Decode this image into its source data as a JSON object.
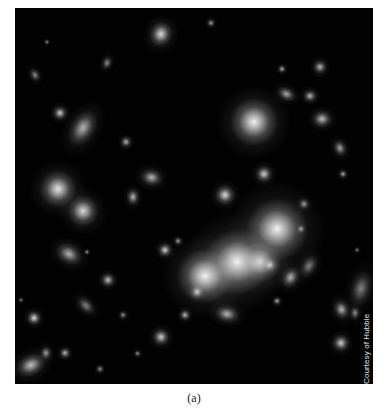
{
  "figure": {
    "background": "#020202",
    "credit": "Courtesy of Hubble",
    "caption": "(a)",
    "galaxies": [
      {
        "x": 222,
        "y": 97,
        "w": 34,
        "h": 34,
        "r": 0,
        "b": 0.95
      },
      {
        "x": 198,
        "y": 232,
        "w": 48,
        "h": 44,
        "r": -20,
        "b": 1.0
      },
      {
        "x": 170,
        "y": 250,
        "w": 40,
        "h": 36,
        "r": 0,
        "b": 0.95
      },
      {
        "x": 240,
        "y": 200,
        "w": 44,
        "h": 42,
        "r": 0,
        "b": 0.95
      },
      {
        "x": 230,
        "y": 240,
        "w": 30,
        "h": 28,
        "r": 0,
        "b": 0.8
      },
      {
        "x": 203,
        "y": 180,
        "w": 14,
        "h": 14,
        "r": 0,
        "b": 0.85
      },
      {
        "x": 243,
        "y": 160,
        "w": 12,
        "h": 12,
        "r": 0,
        "b": 0.8
      },
      {
        "x": 30,
        "y": 168,
        "w": 26,
        "h": 26,
        "r": 0,
        "b": 0.9
      },
      {
        "x": 57,
        "y": 192,
        "w": 22,
        "h": 22,
        "r": 0,
        "b": 0.85
      },
      {
        "x": 139,
        "y": 17,
        "w": 14,
        "h": 18,
        "r": 20,
        "b": 0.85
      },
      {
        "x": 65,
        "y": 106,
        "w": 6,
        "h": 28,
        "r": 30,
        "b": 0.7
      },
      {
        "x": 40,
        "y": 100,
        "w": 10,
        "h": 10,
        "r": 0,
        "b": 0.8
      },
      {
        "x": 107,
        "y": 130,
        "w": 8,
        "h": 8,
        "r": 0,
        "b": 0.7
      },
      {
        "x": 129,
        "y": 166,
        "w": 16,
        "h": 8,
        "r": 10,
        "b": 0.7
      },
      {
        "x": 115,
        "y": 183,
        "w": 6,
        "h": 12,
        "r": 0,
        "b": 0.7
      },
      {
        "x": 145,
        "y": 237,
        "w": 10,
        "h": 10,
        "r": 0,
        "b": 0.8
      },
      {
        "x": 44,
        "y": 242,
        "w": 20,
        "h": 8,
        "r": 30,
        "b": 0.7
      },
      {
        "x": 14,
        "y": 305,
        "w": 10,
        "h": 10,
        "r": 0,
        "b": 0.85
      },
      {
        "x": 5,
        "y": 353,
        "w": 22,
        "h": 8,
        "r": -25,
        "b": 0.75
      },
      {
        "x": 46,
        "y": 341,
        "w": 8,
        "h": 8,
        "r": 0,
        "b": 0.7
      },
      {
        "x": 88,
        "y": 267,
        "w": 10,
        "h": 10,
        "r": 0,
        "b": 0.75
      },
      {
        "x": 140,
        "y": 323,
        "w": 12,
        "h": 12,
        "r": 0,
        "b": 0.8
      },
      {
        "x": 177,
        "y": 279,
        "w": 10,
        "h": 10,
        "r": 0,
        "b": 0.75
      },
      {
        "x": 203,
        "y": 303,
        "w": 18,
        "h": 6,
        "r": 10,
        "b": 0.7
      },
      {
        "x": 166,
        "y": 303,
        "w": 8,
        "h": 8,
        "r": 0,
        "b": 0.7
      },
      {
        "x": 320,
        "y": 329,
        "w": 12,
        "h": 12,
        "r": 0,
        "b": 0.8
      },
      {
        "x": 322,
        "y": 294,
        "w": 8,
        "h": 14,
        "r": -20,
        "b": 0.7
      },
      {
        "x": 300,
        "y": 106,
        "w": 14,
        "h": 10,
        "r": 0,
        "b": 0.75
      },
      {
        "x": 290,
        "y": 84,
        "w": 10,
        "h": 8,
        "r": 0,
        "b": 0.7
      },
      {
        "x": 322,
        "y": 134,
        "w": 6,
        "h": 12,
        "r": -20,
        "b": 0.65
      },
      {
        "x": 325,
        "y": 163,
        "w": 6,
        "h": 6,
        "r": 0,
        "b": 0.65
      },
      {
        "x": 264,
        "y": 83,
        "w": 14,
        "h": 5,
        "r": 25,
        "b": 0.65
      },
      {
        "x": 300,
        "y": 54,
        "w": 10,
        "h": 10,
        "r": 0,
        "b": 0.7
      },
      {
        "x": 264,
        "y": 58,
        "w": 6,
        "h": 6,
        "r": 0,
        "b": 0.65
      },
      {
        "x": 28,
        "y": 340,
        "w": 6,
        "h": 10,
        "r": 0,
        "b": 0.6
      },
      {
        "x": 70,
        "y": 242,
        "w": 4,
        "h": 4,
        "r": 0,
        "b": 0.6
      },
      {
        "x": 259,
        "y": 290,
        "w": 6,
        "h": 6,
        "r": 0,
        "b": 0.65
      },
      {
        "x": 250,
        "y": 252,
        "w": 10,
        "h": 10,
        "r": 0,
        "b": 0.7
      },
      {
        "x": 272,
        "y": 262,
        "w": 8,
        "h": 16,
        "r": 30,
        "b": 0.7
      },
      {
        "x": 283,
        "y": 218,
        "w": 6,
        "h": 6,
        "r": 0,
        "b": 0.6
      },
      {
        "x": 285,
        "y": 192,
        "w": 8,
        "h": 8,
        "r": 0,
        "b": 0.6
      },
      {
        "x": 160,
        "y": 230,
        "w": 6,
        "h": 6,
        "r": 0,
        "b": 0.6
      },
      {
        "x": 193,
        "y": 12,
        "w": 6,
        "h": 6,
        "r": 0,
        "b": 0.6
      },
      {
        "x": 30,
        "y": 32,
        "w": 4,
        "h": 4,
        "r": 0,
        "b": 0.55
      },
      {
        "x": 18,
        "y": 62,
        "w": 4,
        "h": 10,
        "r": -30,
        "b": 0.55
      },
      {
        "x": 90,
        "y": 50,
        "w": 4,
        "h": 10,
        "r": 20,
        "b": 0.55
      },
      {
        "x": 338,
        "y": 300,
        "w": 4,
        "h": 10,
        "r": 0,
        "b": 0.55
      },
      {
        "x": 345,
        "y": 268,
        "w": 3,
        "h": 26,
        "r": 15,
        "b": 0.5
      },
      {
        "x": 70,
        "y": 290,
        "w": 3,
        "h": 16,
        "r": -45,
        "b": 0.5
      },
      {
        "x": 82,
        "y": 358,
        "w": 6,
        "h": 6,
        "r": 0,
        "b": 0.55
      },
      {
        "x": 120,
        "y": 343,
        "w": 5,
        "h": 5,
        "r": 0,
        "b": 0.55
      },
      {
        "x": 105,
        "y": 304,
        "w": 6,
        "h": 6,
        "r": 0,
        "b": 0.55
      },
      {
        "x": 292,
        "y": 249,
        "w": 4,
        "h": 18,
        "r": 30,
        "b": 0.5
      },
      {
        "x": 4,
        "y": 290,
        "w": 4,
        "h": 4,
        "r": 0,
        "b": 0.5
      },
      {
        "x": 340,
        "y": 240,
        "w": 4,
        "h": 4,
        "r": 0,
        "b": 0.5
      }
    ]
  }
}
